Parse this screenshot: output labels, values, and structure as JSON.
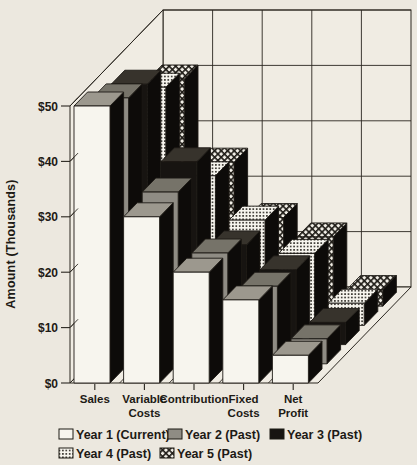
{
  "page": {
    "kind": "scanned 3d bar chart figure",
    "colors": {
      "paper": "#ece8df",
      "wall": "#f0ece3",
      "ink": "#1d1a15",
      "grid_line": "#2a261f",
      "bar_white": "#f7f5ee",
      "bar_gray": "#8f8c84",
      "bar_black": "#171411",
      "bar_side": "#0d0b09",
      "top_white": "#9c988e",
      "top_gray": "#767369",
      "top_black": "#37332c",
      "dots_bg": "#f8f6ef",
      "hatch_bg": "#f1eee6"
    }
  },
  "chart_data": {
    "type": "bar",
    "projection": "3d-depth-rows",
    "title": "",
    "ylabel": "Amount (Thousands)",
    "xlabel": "",
    "values_unit": "US dollars, thousands",
    "categories": [
      "Sales",
      "Variable Costs",
      "Contribution",
      "Fixed Costs",
      "Net Profit"
    ],
    "category_label_lines": [
      [
        "Sales"
      ],
      [
        "Variable",
        "Costs"
      ],
      [
        "Contribution"
      ],
      [
        "Fixed",
        "Costs"
      ],
      [
        "Net",
        "Profit"
      ]
    ],
    "series": [
      {
        "name": "Year 1 (Current)",
        "fill_style": "white",
        "values": [
          50,
          30,
          20,
          15,
          5
        ]
      },
      {
        "name": "Year 2 (Past)",
        "fill_style": "gray",
        "values": [
          48,
          31,
          20,
          14,
          4.5
        ]
      },
      {
        "name": "Year 3 (Past)",
        "fill_style": "black",
        "values": [
          47,
          33,
          18,
          13.5,
          4
        ]
      },
      {
        "name": "Year 4 (Past)",
        "fill_style": "dots",
        "values": [
          43,
          27,
          19,
          13,
          4
        ]
      },
      {
        "name": "Year 5 (Past)",
        "fill_style": "hatch",
        "values": [
          41,
          26,
          16,
          12.5,
          3
        ]
      }
    ],
    "ylim": [
      0,
      50
    ],
    "y_ticks": [
      "$0",
      "$10",
      "$20",
      "$30",
      "$40",
      "$50"
    ],
    "grid": true,
    "legend_position": "bottom",
    "legend_rows": [
      [
        0,
        1,
        2
      ],
      [
        3,
        4
      ]
    ]
  }
}
